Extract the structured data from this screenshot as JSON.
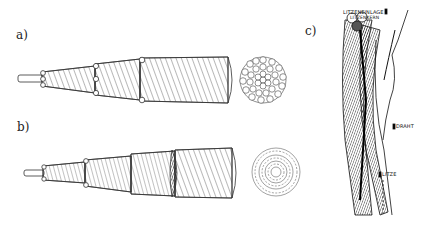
{
  "figure": {
    "panels": [
      {
        "id": "a",
        "label": "a)",
        "description": "Parallel lay strand, stepped cutaway with cross-section"
      },
      {
        "id": "b",
        "label": "b)",
        "description": "Cross lay strand, stepped cutaway with cross-section"
      },
      {
        "id": "c",
        "label": "c)",
        "description": "Stranded wire rope with annotations"
      }
    ],
    "annotations": {
      "litzeneinlage": "LITZENEINLAGE",
      "litzenkern": "LITZENKERN",
      "draht": "DRAHT",
      "litze": "LITZE"
    },
    "colors": {
      "ink": "#1a1a1a",
      "background": "#ffffff"
    }
  }
}
